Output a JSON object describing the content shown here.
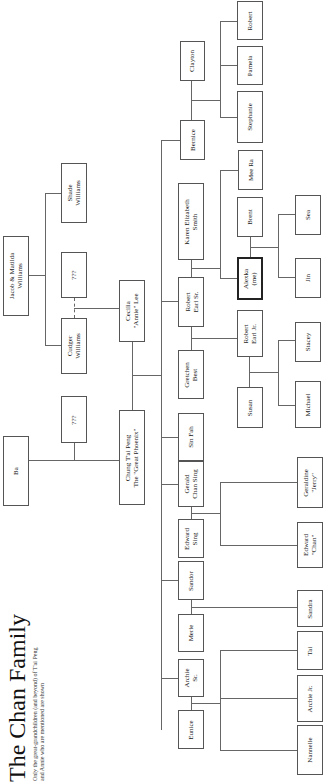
{
  "header": {
    "title": "The Chan Family",
    "subtitle": "Only the great-grandchildren (and beyond) of T'ai Peng\nand Annie who are mentioned are shown"
  },
  "people": {
    "jacob_matilda": "Jacob & Matilda\nWilliams",
    "shade": "Shade\nWilliams",
    "unknown_spouse_williams": "???",
    "cudger": "Cudger\nWilliams",
    "unknown_spouse_ba": "???",
    "ba": "Ba",
    "chung_tai_peng": "Chung T'ai Peng\nThe \"Great Phoenix\"",
    "cecilia": "Cecilia\n\"Annie\" Lee",
    "robert_sr": "Robert\nEarl Sr.",
    "karen": "Karen Elizabeth\nSmith",
    "gretchen": "Gretchen\nBest",
    "sin_fah": "Sin Fah",
    "gerald": "Gerald\nChan Sing",
    "edward_sing": "Edward\nSing",
    "sandor": "Sandor",
    "merle": "Merle",
    "archie_sr": "Archie\nSr.",
    "eunice": "Eunice",
    "bernice": "Bernice",
    "clayton": "Clayton",
    "mee_ra": "Mee Ra",
    "brent": "Brent",
    "alexka": "Alexka\n(me)",
    "robert_jr": "Robert\nEarl Jr.",
    "susan": "Susan",
    "stephanie": "Stephanie",
    "pamela": "Pamela",
    "robert": "Robert",
    "sea": "Sea",
    "jin": "Jin",
    "stacey": "Stacey",
    "michael": "Michael",
    "geraldine": "Geraldine\n\"Jerry\"",
    "edward_chan": "Edward\n\"Chan\"",
    "sandra": "Sandra",
    "tai": "Tai",
    "archie_jr": "Archie Jr.",
    "nannelle": "Nannelle"
  },
  "colors": {
    "line": "#666666",
    "border": "#555555",
    "highlight_border": "#222222"
  }
}
